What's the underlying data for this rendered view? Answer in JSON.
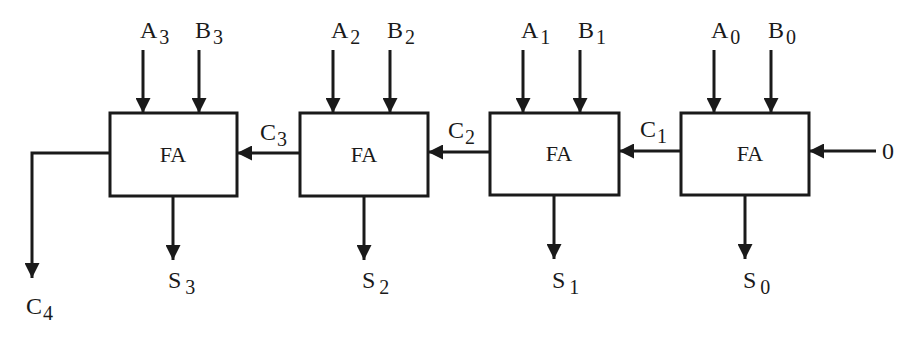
{
  "diagram": {
    "block_label": "FA",
    "stages": [
      {
        "index": 3,
        "a": "A",
        "a_sub": "3",
        "b": "B",
        "b_sub": "3",
        "s": "S",
        "s_sub": "3",
        "cin": "C",
        "cin_sub": "3",
        "x": 110
      },
      {
        "index": 2,
        "a": "A",
        "a_sub": "2",
        "b": "B",
        "b_sub": "2",
        "s": "S",
        "s_sub": "2",
        "cin": "C",
        "cin_sub": "2",
        "x": 300
      },
      {
        "index": 1,
        "a": "A",
        "a_sub": "1",
        "b": "B",
        "b_sub": "1",
        "s": "S",
        "s_sub": "1",
        "cin": "C",
        "cin_sub": "1",
        "x": 490
      },
      {
        "index": 0,
        "a": "A",
        "a_sub": "0",
        "b": "B",
        "b_sub": "0",
        "s": "S",
        "s_sub": "0",
        "x": 681
      }
    ],
    "carry_in": "0",
    "carry_out": {
      "label": "C",
      "sub": "4"
    }
  }
}
